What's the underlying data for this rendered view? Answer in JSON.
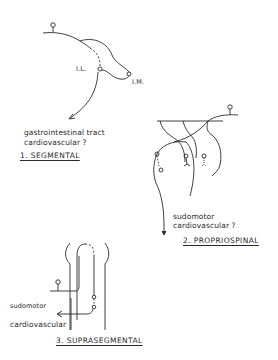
{
  "panels": [
    {
      "id": "segmental",
      "title": "1. SEGMENTAL",
      "labels": {
        "il": "I.L.",
        "im": "I.M.",
        "output_line1": "gastrointestinal  tract",
        "output_line2": "cardiovascular ?"
      }
    },
    {
      "id": "propriospinal",
      "title": "2. PROPRIOSPINAL",
      "labels": {
        "output_line1": "sudomotor",
        "output_line2": "cardiovascular ?"
      }
    },
    {
      "id": "suprasegmental",
      "title": "3. SUPRASEGMENTAL",
      "labels": {
        "output_line1": "sudomotor",
        "output_line2": "cardiovascular"
      }
    }
  ],
  "colors": {
    "ink": "#2a2a2a",
    "background": "#ffffff"
  }
}
